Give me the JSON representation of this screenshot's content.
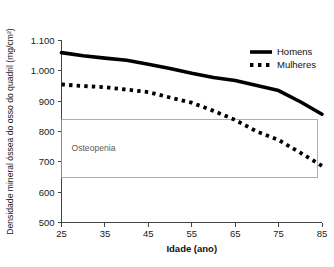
{
  "chart_data": {
    "type": "line",
    "title": "",
    "xlabel": "Idade (ano)",
    "ylabel": "Densidade mineral óssea do osso do quadril (mg/cm²)",
    "xlim": [
      25,
      85
    ],
    "ylim": [
      500,
      1100
    ],
    "grid": false,
    "legend_position": "top-right",
    "x_ticks": [
      25,
      35,
      45,
      55,
      65,
      75,
      85
    ],
    "x_tick_labels": [
      "25",
      "35",
      "45",
      "55",
      "65",
      "75",
      "85"
    ],
    "y_ticks": [
      500,
      600,
      700,
      800,
      900,
      1000,
      1100
    ],
    "y_tick_labels": [
      "500",
      "600",
      "700",
      "800",
      "900",
      "1.000",
      "1.100"
    ],
    "x": [
      25,
      30,
      35,
      40,
      45,
      50,
      55,
      60,
      65,
      70,
      75,
      80,
      85
    ],
    "series": [
      {
        "name": "Homens",
        "style": "solid",
        "color": "#000000",
        "values": [
          1060,
          1050,
          1042,
          1035,
          1022,
          1008,
          992,
          978,
          968,
          952,
          935,
          898,
          857
        ]
      },
      {
        "name": "Mulheres",
        "style": "dotted",
        "color": "#000000",
        "values": [
          955,
          950,
          946,
          938,
          930,
          912,
          895,
          868,
          838,
          800,
          772,
          730,
          687
        ]
      }
    ],
    "annotations": [
      {
        "name": "osteopenia-band",
        "label": "Osteopenia",
        "y_min": 650,
        "y_max": 840,
        "x_min": 25,
        "x_max": 84,
        "border_color": "#9a9a9a",
        "label_color": "#5a5a5a"
      }
    ]
  },
  "legend": {
    "items": [
      {
        "label": "Homens",
        "style": "solid"
      },
      {
        "label": "Mulheres",
        "style": "dotted"
      }
    ]
  }
}
